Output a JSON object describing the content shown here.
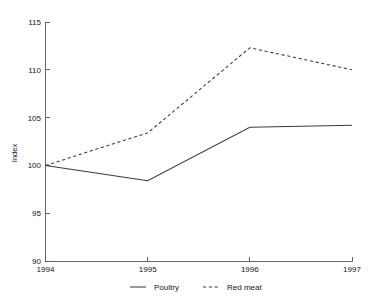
{
  "chart_data": {
    "type": "line",
    "title": "",
    "subtitle": "",
    "xlabel": "",
    "ylabel": "Index",
    "x": [
      1994,
      1995,
      1996,
      1997
    ],
    "categories": [
      "1994",
      "1995",
      "1996",
      "1997"
    ],
    "series": [
      {
        "name": "Poultry",
        "style": "solid",
        "color": "#3a3a3a",
        "values": [
          100,
          98.4,
          104,
          104.2
        ]
      },
      {
        "name": "Red meat",
        "style": "dashed",
        "color": "#3a3a3a",
        "values": [
          100,
          103.4,
          112.3,
          110
        ]
      }
    ],
    "ylim": [
      90,
      115
    ],
    "yticks": [
      90,
      95,
      100,
      105,
      110,
      115
    ],
    "ytick_labels": [
      "90",
      "95",
      "100",
      "105",
      "110",
      "115"
    ],
    "xlim": [
      1994,
      1997
    ],
    "xticks": [
      1994,
      1995,
      1996,
      1997
    ],
    "xtick_labels": [
      "1994",
      "1995",
      "1996",
      "1997"
    ],
    "grid": false,
    "legend_position": "bottom",
    "legend_entries": [
      "Poultry",
      "Red meat"
    ]
  },
  "axes": {
    "y_title": "Index",
    "y_ticks": [
      {
        "label": "115",
        "value": 115
      },
      {
        "label": "110",
        "value": 110
      },
      {
        "label": "105",
        "value": 105
      },
      {
        "label": "100",
        "value": 100
      },
      {
        "label": "95",
        "value": 95
      },
      {
        "label": "90",
        "value": 90
      }
    ],
    "x_ticks": [
      {
        "label": "1994",
        "value": 1994
      },
      {
        "label": "1995",
        "value": 1995
      },
      {
        "label": "1996",
        "value": 1996
      },
      {
        "label": "1997",
        "value": 1997
      }
    ]
  },
  "legend": {
    "items": [
      {
        "label": "Poultry",
        "style": "solid"
      },
      {
        "label": "Red meat",
        "style": "dashed"
      }
    ]
  }
}
